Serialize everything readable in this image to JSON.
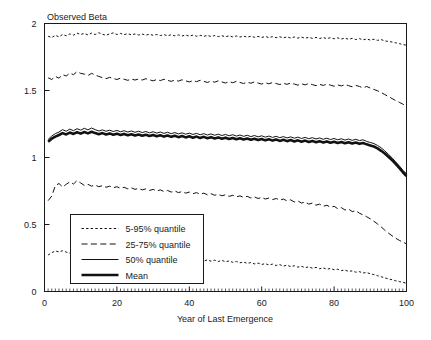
{
  "chart_data": {
    "type": "line",
    "title": "",
    "ylabel": "Observed Beta",
    "xlabel": "Year of Last Emergence",
    "xlim": [
      0,
      100
    ],
    "ylim": [
      0,
      2
    ],
    "xticks": [
      0,
      20,
      40,
      60,
      80,
      100
    ],
    "xtick_labels": [
      "0",
      "20",
      "40",
      "60",
      "80",
      "100"
    ],
    "yticks": [
      0,
      0.5,
      1,
      1.5,
      2
    ],
    "ytick_labels": [
      "0",
      "0.5",
      "1",
      "1.5",
      "2"
    ],
    "grid": false,
    "legend_position": "lower-left-inside",
    "legend_entries": [
      {
        "label": "5-95% quantile",
        "style": "dotted"
      },
      {
        "label": "25-75% quantile",
        "style": "dashed"
      },
      {
        "label": "50% quantile",
        "style": "solid-thin"
      },
      {
        "label": "Mean",
        "style": "solid-thick"
      }
    ],
    "x": [
      1,
      2,
      3,
      4,
      5,
      6,
      7,
      8,
      9,
      10,
      11,
      12,
      13,
      14,
      15,
      16,
      17,
      18,
      19,
      20,
      21,
      22,
      23,
      24,
      25,
      26,
      27,
      28,
      29,
      30,
      31,
      32,
      33,
      34,
      35,
      36,
      37,
      38,
      39,
      40,
      41,
      42,
      43,
      44,
      45,
      46,
      47,
      48,
      49,
      50,
      51,
      52,
      53,
      54,
      55,
      56,
      57,
      58,
      59,
      60,
      61,
      62,
      63,
      64,
      65,
      66,
      67,
      68,
      69,
      70,
      71,
      72,
      73,
      74,
      75,
      76,
      77,
      78,
      79,
      80,
      81,
      82,
      83,
      84,
      85,
      86,
      87,
      88,
      89,
      90,
      91,
      92,
      93,
      94,
      95,
      96,
      97,
      98,
      99,
      100
    ],
    "series": [
      {
        "name": "95% quantile",
        "style": "dotted",
        "values": [
          1.905,
          1.895,
          1.912,
          1.9,
          1.918,
          1.908,
          1.922,
          1.913,
          1.928,
          1.918,
          1.926,
          1.915,
          1.928,
          1.918,
          1.931,
          1.92,
          1.912,
          1.922,
          1.93,
          1.918,
          1.926,
          1.917,
          1.924,
          1.915,
          1.922,
          1.914,
          1.921,
          1.913,
          1.92,
          1.912,
          1.918,
          1.91,
          1.917,
          1.909,
          1.916,
          1.908,
          1.915,
          1.907,
          1.914,
          1.906,
          1.913,
          1.905,
          1.912,
          1.904,
          1.911,
          1.903,
          1.91,
          1.902,
          1.909,
          1.901,
          1.908,
          1.9,
          1.907,
          1.899,
          1.906,
          1.898,
          1.905,
          1.897,
          1.904,
          1.896,
          1.903,
          1.895,
          1.902,
          1.894,
          1.901,
          1.893,
          1.9,
          1.892,
          1.899,
          1.891,
          1.898,
          1.89,
          1.897,
          1.889,
          1.896,
          1.888,
          1.895,
          1.887,
          1.894,
          1.886,
          1.893,
          1.884,
          1.891,
          1.882,
          1.889,
          1.88,
          1.887,
          1.878,
          1.885,
          1.876,
          1.883,
          1.874,
          1.88,
          1.87,
          1.866,
          1.862,
          1.856,
          1.85,
          1.843,
          1.838
        ]
      },
      {
        "name": "75% quantile",
        "style": "dashed",
        "values": [
          1.595,
          1.582,
          1.605,
          1.592,
          1.618,
          1.608,
          1.63,
          1.618,
          1.641,
          1.628,
          1.622,
          1.612,
          1.628,
          1.615,
          1.605,
          1.596,
          1.588,
          1.598,
          1.59,
          1.582,
          1.592,
          1.584,
          1.576,
          1.586,
          1.578,
          1.586,
          1.578,
          1.588,
          1.58,
          1.572,
          1.582,
          1.574,
          1.584,
          1.576,
          1.568,
          1.578,
          1.57,
          1.58,
          1.572,
          1.564,
          1.574,
          1.566,
          1.576,
          1.568,
          1.56,
          1.57,
          1.562,
          1.572,
          1.564,
          1.556,
          1.566,
          1.558,
          1.568,
          1.56,
          1.552,
          1.562,
          1.554,
          1.564,
          1.556,
          1.548,
          1.558,
          1.55,
          1.56,
          1.552,
          1.544,
          1.554,
          1.546,
          1.556,
          1.548,
          1.54,
          1.55,
          1.542,
          1.552,
          1.544,
          1.536,
          1.546,
          1.538,
          1.548,
          1.54,
          1.532,
          1.542,
          1.534,
          1.544,
          1.536,
          1.528,
          1.538,
          1.53,
          1.52,
          1.53,
          1.518,
          1.508,
          1.498,
          1.485,
          1.47,
          1.455,
          1.44,
          1.425,
          1.412,
          1.398,
          1.385
        ]
      },
      {
        "name": "50% quantile",
        "style": "solid-thin",
        "values": [
          1.135,
          1.16,
          1.178,
          1.19,
          1.208,
          1.196,
          1.212,
          1.2,
          1.215,
          1.204,
          1.218,
          1.206,
          1.22,
          1.208,
          1.198,
          1.206,
          1.196,
          1.204,
          1.194,
          1.202,
          1.192,
          1.2,
          1.19,
          1.198,
          1.188,
          1.196,
          1.186,
          1.194,
          1.184,
          1.192,
          1.182,
          1.19,
          1.18,
          1.188,
          1.178,
          1.186,
          1.176,
          1.184,
          1.174,
          1.182,
          1.172,
          1.18,
          1.17,
          1.178,
          1.168,
          1.176,
          1.166,
          1.174,
          1.164,
          1.172,
          1.162,
          1.17,
          1.16,
          1.168,
          1.158,
          1.166,
          1.156,
          1.164,
          1.154,
          1.162,
          1.152,
          1.16,
          1.15,
          1.158,
          1.148,
          1.156,
          1.146,
          1.154,
          1.144,
          1.152,
          1.142,
          1.15,
          1.14,
          1.148,
          1.138,
          1.146,
          1.136,
          1.144,
          1.134,
          1.142,
          1.132,
          1.14,
          1.13,
          1.138,
          1.128,
          1.136,
          1.126,
          1.132,
          1.12,
          1.112,
          1.104,
          1.09,
          1.072,
          1.05,
          1.024,
          0.998,
          0.968,
          0.938,
          0.905,
          0.878
        ]
      },
      {
        "name": "Mean",
        "style": "solid-thick",
        "values": [
          1.118,
          1.14,
          1.156,
          1.168,
          1.182,
          1.172,
          1.186,
          1.176,
          1.188,
          1.178,
          1.19,
          1.18,
          1.192,
          1.182,
          1.174,
          1.182,
          1.172,
          1.18,
          1.17,
          1.178,
          1.168,
          1.176,
          1.166,
          1.174,
          1.164,
          1.172,
          1.162,
          1.17,
          1.16,
          1.168,
          1.158,
          1.166,
          1.156,
          1.164,
          1.154,
          1.162,
          1.152,
          1.16,
          1.15,
          1.158,
          1.148,
          1.156,
          1.146,
          1.154,
          1.144,
          1.152,
          1.142,
          1.15,
          1.14,
          1.148,
          1.138,
          1.146,
          1.136,
          1.144,
          1.134,
          1.142,
          1.132,
          1.14,
          1.13,
          1.138,
          1.128,
          1.136,
          1.126,
          1.134,
          1.124,
          1.132,
          1.122,
          1.13,
          1.12,
          1.128,
          1.118,
          1.126,
          1.116,
          1.124,
          1.114,
          1.122,
          1.112,
          1.12,
          1.11,
          1.118,
          1.108,
          1.116,
          1.106,
          1.114,
          1.104,
          1.112,
          1.102,
          1.108,
          1.098,
          1.09,
          1.082,
          1.068,
          1.05,
          1.03,
          1.006,
          0.98,
          0.952,
          0.922,
          0.89,
          0.862
        ]
      },
      {
        "name": "25% quantile",
        "style": "dashed",
        "values": [
          0.678,
          0.712,
          0.79,
          0.806,
          0.78,
          0.8,
          0.818,
          0.802,
          0.828,
          0.81,
          0.792,
          0.8,
          0.786,
          0.794,
          0.782,
          0.79,
          0.778,
          0.786,
          0.774,
          0.782,
          0.77,
          0.778,
          0.766,
          0.774,
          0.762,
          0.77,
          0.758,
          0.766,
          0.754,
          0.762,
          0.75,
          0.758,
          0.746,
          0.754,
          0.742,
          0.75,
          0.738,
          0.746,
          0.734,
          0.742,
          0.73,
          0.738,
          0.726,
          0.734,
          0.722,
          0.73,
          0.718,
          0.726,
          0.714,
          0.722,
          0.71,
          0.718,
          0.706,
          0.714,
          0.702,
          0.71,
          0.698,
          0.706,
          0.694,
          0.702,
          0.69,
          0.698,
          0.686,
          0.694,
          0.682,
          0.69,
          0.676,
          0.684,
          0.668,
          0.676,
          0.66,
          0.668,
          0.652,
          0.66,
          0.644,
          0.652,
          0.636,
          0.644,
          0.628,
          0.636,
          0.618,
          0.626,
          0.608,
          0.616,
          0.596,
          0.604,
          0.584,
          0.572,
          0.558,
          0.542,
          0.524,
          0.504,
          0.482,
          0.458,
          0.436,
          0.416,
          0.398,
          0.382,
          0.368,
          0.356
        ]
      },
      {
        "name": "5% quantile",
        "style": "dotted",
        "values": [
          0.272,
          0.29,
          0.302,
          0.296,
          0.304,
          0.294,
          0.286,
          0.294,
          0.284,
          0.276,
          0.284,
          0.274,
          0.266,
          0.274,
          0.264,
          0.256,
          0.264,
          0.254,
          0.262,
          0.252,
          0.26,
          0.25,
          0.258,
          0.248,
          0.256,
          0.246,
          0.254,
          0.244,
          0.252,
          0.242,
          0.25,
          0.24,
          0.248,
          0.238,
          0.246,
          0.236,
          0.244,
          0.234,
          0.242,
          0.232,
          0.24,
          0.23,
          0.238,
          0.228,
          0.236,
          0.226,
          0.234,
          0.224,
          0.232,
          0.222,
          0.228,
          0.218,
          0.224,
          0.214,
          0.22,
          0.21,
          0.216,
          0.206,
          0.212,
          0.202,
          0.208,
          0.198,
          0.204,
          0.194,
          0.2,
          0.19,
          0.196,
          0.186,
          0.192,
          0.182,
          0.188,
          0.178,
          0.184,
          0.174,
          0.18,
          0.17,
          0.176,
          0.166,
          0.172,
          0.162,
          0.166,
          0.156,
          0.16,
          0.15,
          0.154,
          0.144,
          0.148,
          0.138,
          0.142,
          0.132,
          0.126,
          0.118,
          0.11,
          0.102,
          0.094,
          0.088,
          0.08,
          0.074,
          0.068,
          0.062
        ]
      }
    ]
  }
}
